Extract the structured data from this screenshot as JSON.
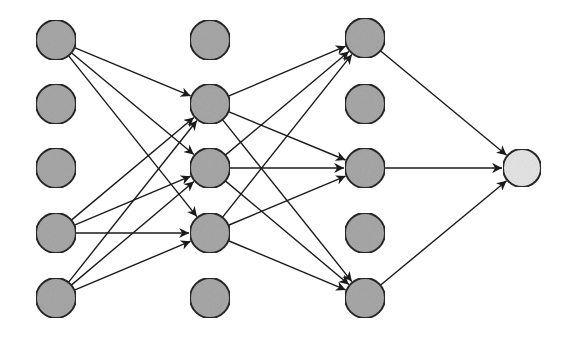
{
  "diagram": {
    "type": "feedforward-neural-network",
    "colors": {
      "background": "#ffffff",
      "hidden_node_fill": "#a9a9a9",
      "output_node_fill": "#e6e6e6",
      "node_stroke": "#2a2a2a",
      "edge": "#1a1a1a"
    },
    "node_radius": 20,
    "layers": [
      {
        "name": "input-layer",
        "x": 56,
        "nodes": [
          {
            "y": 40,
            "active": true
          },
          {
            "y": 104,
            "active": false
          },
          {
            "y": 168,
            "active": false
          },
          {
            "y": 233,
            "active": true
          },
          {
            "y": 298,
            "active": true
          }
        ]
      },
      {
        "name": "hidden-layer-1",
        "x": 210,
        "nodes": [
          {
            "y": 40,
            "active": false
          },
          {
            "y": 104,
            "active": true
          },
          {
            "y": 168,
            "active": true
          },
          {
            "y": 233,
            "active": true
          },
          {
            "y": 298,
            "active": false
          }
        ]
      },
      {
        "name": "hidden-layer-2",
        "x": 365,
        "nodes": [
          {
            "y": 38,
            "active": true
          },
          {
            "y": 104,
            "active": false
          },
          {
            "y": 168,
            "active": true
          },
          {
            "y": 233,
            "active": false
          },
          {
            "y": 298,
            "active": true
          }
        ]
      },
      {
        "name": "output-layer",
        "x": 522,
        "nodes": [
          {
            "y": 168,
            "active": true,
            "output": true
          }
        ]
      }
    ],
    "edges": [
      {
        "from": [
          0,
          0
        ],
        "to": [
          1,
          1
        ]
      },
      {
        "from": [
          0,
          0
        ],
        "to": [
          1,
          2
        ]
      },
      {
        "from": [
          0,
          0
        ],
        "to": [
          1,
          3
        ]
      },
      {
        "from": [
          0,
          3
        ],
        "to": [
          1,
          1
        ]
      },
      {
        "from": [
          0,
          3
        ],
        "to": [
          1,
          2
        ]
      },
      {
        "from": [
          0,
          3
        ],
        "to": [
          1,
          3
        ]
      },
      {
        "from": [
          0,
          4
        ],
        "to": [
          1,
          1
        ]
      },
      {
        "from": [
          0,
          4
        ],
        "to": [
          1,
          2
        ]
      },
      {
        "from": [
          0,
          4
        ],
        "to": [
          1,
          3
        ]
      },
      {
        "from": [
          1,
          1
        ],
        "to": [
          2,
          0
        ]
      },
      {
        "from": [
          1,
          1
        ],
        "to": [
          2,
          2
        ]
      },
      {
        "from": [
          1,
          1
        ],
        "to": [
          2,
          4
        ]
      },
      {
        "from": [
          1,
          2
        ],
        "to": [
          2,
          0
        ]
      },
      {
        "from": [
          1,
          2
        ],
        "to": [
          2,
          2
        ]
      },
      {
        "from": [
          1,
          2
        ],
        "to": [
          2,
          4
        ]
      },
      {
        "from": [
          1,
          3
        ],
        "to": [
          2,
          0
        ]
      },
      {
        "from": [
          1,
          3
        ],
        "to": [
          2,
          2
        ]
      },
      {
        "from": [
          1,
          3
        ],
        "to": [
          2,
          4
        ]
      },
      {
        "from": [
          2,
          0
        ],
        "to": [
          3,
          0
        ]
      },
      {
        "from": [
          2,
          2
        ],
        "to": [
          3,
          0
        ]
      },
      {
        "from": [
          2,
          4
        ],
        "to": [
          3,
          0
        ]
      }
    ]
  }
}
